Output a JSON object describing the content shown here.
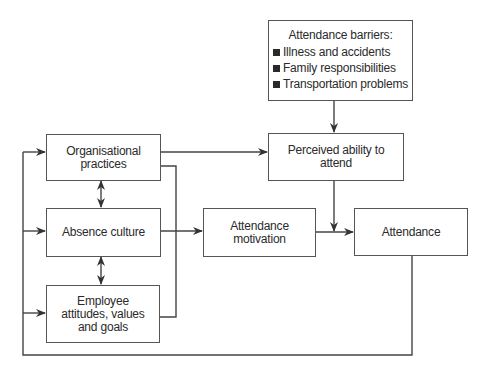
{
  "diagram": {
    "nodes": {
      "barriers": {
        "title": "Attendance barriers:",
        "items": [
          "Illness and accidents",
          "Family responsibilities",
          "Transportation problems"
        ]
      },
      "org_practices": {
        "lines": [
          "Organisational",
          "practices"
        ]
      },
      "absence_culture": {
        "lines": [
          "Absence culture"
        ]
      },
      "employee": {
        "lines": [
          "Employee",
          "attitudes, values",
          "and goals"
        ]
      },
      "perceived": {
        "lines": [
          "Perceived ability to",
          "attend"
        ]
      },
      "motivation": {
        "lines": [
          "Attendance",
          "motivation"
        ]
      },
      "attendance": {
        "lines": [
          "Attendance"
        ]
      }
    },
    "edges": [
      {
        "from": "barriers",
        "to": "perceived"
      },
      {
        "from": "org_practices",
        "to": "perceived"
      },
      {
        "from": "org_practices",
        "to": "motivation"
      },
      {
        "from": "employee",
        "to": "motivation"
      },
      {
        "from": "absence_culture",
        "to": "motivation"
      },
      {
        "from": "org_practices",
        "to": "absence_culture",
        "bidirectional": true
      },
      {
        "from": "absence_culture",
        "to": "employee",
        "bidirectional": true
      },
      {
        "from": "perceived",
        "to": "attendance"
      },
      {
        "from": "motivation",
        "to": "attendance"
      },
      {
        "from": "attendance",
        "to": "org_practices",
        "feedback": true
      },
      {
        "from": "attendance",
        "to": "absence_culture",
        "feedback": true
      },
      {
        "from": "attendance",
        "to": "employee",
        "feedback": true
      }
    ]
  }
}
